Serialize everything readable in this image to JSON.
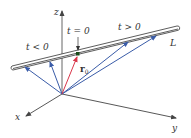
{
  "diagram": {
    "axes": {
      "x_label": "x",
      "y_label": "y",
      "z_label": "z"
    },
    "line_label": "L",
    "labels": {
      "t_negative": "t < 0",
      "t_zero": "t = 0",
      "t_positive": "t > 0",
      "r0_main": "r",
      "r0_sub": "0"
    },
    "colors": {
      "axis": "#444444",
      "line": "#333333",
      "position_vectors": "#3a5ca8",
      "r0_vector": "#d9364a",
      "point": "#1a5a1a"
    },
    "vectors": {
      "count_blue": 5,
      "count_red": 1
    }
  }
}
